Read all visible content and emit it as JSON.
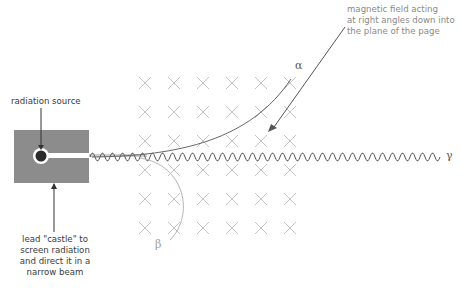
{
  "labels": {
    "radiation_source": "radiation source",
    "magnetic_field": [
      "magnetic field acting",
      "at right angles down into",
      "the plane of the page"
    ],
    "lead_castle": [
      "lead \"castle\" to",
      "screen radiation",
      "and direct it in a",
      "narrow beam"
    ],
    "alpha": "α",
    "beta": "β",
    "gamma": "γ"
  },
  "field_grid": {
    "columns": 6,
    "rows": 6,
    "symbol": "cross-into-page"
  },
  "colors": {
    "lead_castle": "#8c8c8c",
    "source": "#2b2b2b",
    "cross": "#c4c4c4",
    "gamma_wave": "#555555",
    "alpha_path": "#666666",
    "beta_path": "#b5b5b5",
    "text": "#3a3a3a"
  }
}
